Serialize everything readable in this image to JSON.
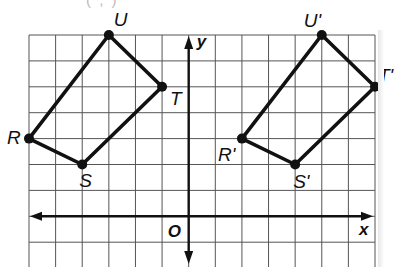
{
  "caption_fragment": "( ,  )",
  "grid": {
    "x_min": -6,
    "x_max": 7,
    "y_min": -2,
    "y_max": 7,
    "line_color": "#555555",
    "stroke_color": "#111111"
  },
  "axes": {
    "x_label": "x",
    "y_label": "y",
    "origin_label": "O"
  },
  "figures": [
    {
      "name": "RSTU",
      "vertices": [
        {
          "label": "R",
          "x": -6,
          "y": 3
        },
        {
          "label": "S",
          "x": -4,
          "y": 2
        },
        {
          "label": "T",
          "x": -1,
          "y": 5
        },
        {
          "label": "U",
          "x": -3,
          "y": 7
        }
      ]
    },
    {
      "name": "R'S'T'U'",
      "vertices": [
        {
          "label": "R'",
          "x": 2,
          "y": 3
        },
        {
          "label": "S'",
          "x": 4,
          "y": 2
        },
        {
          "label": "T'",
          "x": 7,
          "y": 5
        },
        {
          "label": "U'",
          "x": 5,
          "y": 7
        }
      ]
    }
  ]
}
